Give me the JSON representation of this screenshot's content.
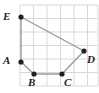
{
  "figure": {
    "background_color": "#ffffff",
    "width": 99,
    "height": 93
  },
  "grid": {
    "line_color": "#d9d9dc",
    "line_width": 1,
    "cell_size": 13.5,
    "x_start": 20,
    "y_start": 5,
    "columns": 6,
    "rows": 6,
    "x_lines": [
      20,
      33.5,
      47,
      60.5,
      74,
      87.5,
      98
    ],
    "y_lines": [
      5,
      18.5,
      32,
      45.5,
      59,
      72.5,
      86
    ]
  },
  "shape": {
    "type": "polygon",
    "name": "ABCDE",
    "stroke_color": "#9a9a9e",
    "stroke_width": 1.4,
    "fill": "none",
    "point_color": "#231f20",
    "point_radius": 2.6,
    "path": "21,17 84,51 62,74 34,74 21,62",
    "vertices": [
      {
        "label": "E",
        "x": 21,
        "y": 17,
        "label_x": 3,
        "label_y": 11,
        "grid_coords": [
          0,
          5
        ]
      },
      {
        "label": "D",
        "x": 84,
        "y": 51,
        "label_x": 87,
        "label_y": 54,
        "grid_coords": [
          5,
          2.5
        ]
      },
      {
        "label": "C",
        "x": 62,
        "y": 74,
        "label_x": 64,
        "label_y": 77,
        "grid_coords": [
          3,
          1
        ]
      },
      {
        "label": "B",
        "x": 34,
        "y": 74,
        "label_x": 28,
        "label_y": 77,
        "grid_coords": [
          1,
          1
        ]
      },
      {
        "label": "A",
        "x": 21,
        "y": 62,
        "label_x": 3,
        "label_y": 55,
        "grid_coords": [
          0,
          2
        ]
      }
    ]
  }
}
